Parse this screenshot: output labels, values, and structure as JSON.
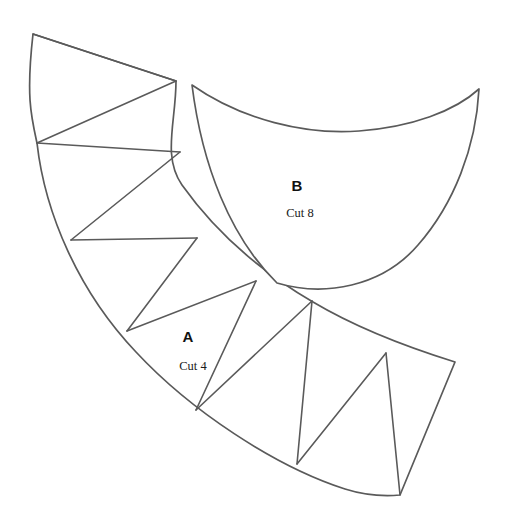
{
  "document": {
    "title": "Sewing Pattern Template Sheet",
    "background_color": "#ffffff",
    "line_color": "#5a5a5a",
    "text_color": "#111111",
    "width": 505,
    "height": 527
  },
  "pieces": [
    {
      "id": "piece-a",
      "letter": "A",
      "cut_label": "Cut 4",
      "letter_x": 188,
      "letter_y": 338,
      "cut_x": 193,
      "cut_y": 367,
      "shape": "annular-sector-with-triangles",
      "outline_path": "M 33 34 C 26 96 31 116 37 143 C 45 214 79 292 136 352 C 190 410 274 466 345 489 C 370 497 388 496 400 495 L 455 362 C 410 348 355 327 313 302 C 260 271 214 230 182 185 C 162 156 176 122 176 81 Z",
      "fold_lines": [
        "M 33 34 L 176 81",
        "M 176 81 L 37 143",
        "M 37 143 L 180 152",
        "M 180 152 L 71 240",
        "M 71 240 L 197 238",
        "M 197 238 L 127 331",
        "M 127 331 L 256 281",
        "M 256 281 L 196 410",
        "M 196 410 L 312 301",
        "M 312 301 L 297 464",
        "M 297 464 L 386 353",
        "M 386 353 L 400 495"
      ]
    },
    {
      "id": "piece-b",
      "letter": "B",
      "cut_label": "Cut 8",
      "letter_x": 297,
      "letter_y": 187,
      "cut_x": 300,
      "cut_y": 214,
      "shape": "curved-quadrilateral",
      "outline_path": "M 192 85 C 242 120 306 135 359 131 C 412 127 455 111 479 89 C 476 147 454 204 418 245 C 382 287 324 297 277 283 C 230 237 202 165 192 85 Z",
      "fold_lines": []
    }
  ]
}
